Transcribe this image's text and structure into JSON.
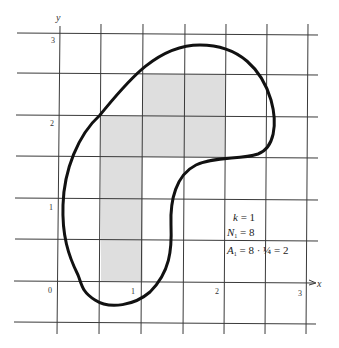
{
  "figure": {
    "axis_labels": {
      "x": "x",
      "y": "y"
    },
    "x_ticks": [
      "0",
      "1",
      "2",
      "3"
    ],
    "y_ticks": [
      "1",
      "2",
      "3"
    ],
    "grid_spacing": "1/2",
    "shaded_cell_count": 8,
    "annotations": {
      "k_var": "k",
      "k_eq": " = 1",
      "n_var": "N",
      "n_sub": "1",
      "n_eq": " = 8",
      "a_var": "A",
      "a_sub": "1",
      "a_eq": " = 8 · ¼ = 2"
    },
    "colors": {
      "grid": "#3a3a3a",
      "shade": "#dedede",
      "curve": "#111111"
    }
  }
}
